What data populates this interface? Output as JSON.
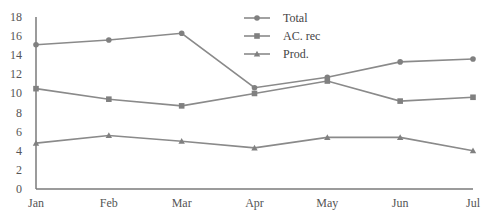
{
  "chart_data": {
    "type": "line",
    "title": "",
    "xlabel": "",
    "ylabel": "",
    "categories": [
      "Jan",
      "Feb",
      "Mar",
      "Apr",
      "May",
      "Jun",
      "Jul"
    ],
    "ylim": [
      0,
      18
    ],
    "yticks": [
      0,
      2,
      4,
      6,
      8,
      10,
      12,
      14,
      16,
      18
    ],
    "grid": false,
    "legend_position": "top-center",
    "series": [
      {
        "name": "Total",
        "marker": "circle",
        "color": "#8a8a8a",
        "values": [
          15.1,
          15.6,
          16.3,
          10.6,
          11.7,
          13.3,
          13.6
        ]
      },
      {
        "name": "AC. rec",
        "marker": "square",
        "color": "#8a8a8a",
        "values": [
          10.5,
          9.4,
          8.7,
          10.0,
          11.3,
          9.2,
          9.6
        ]
      },
      {
        "name": "Prod.",
        "marker": "triangle",
        "color": "#8a8a8a",
        "values": [
          4.8,
          5.6,
          5.0,
          4.3,
          5.4,
          5.4,
          4.0
        ]
      }
    ]
  }
}
